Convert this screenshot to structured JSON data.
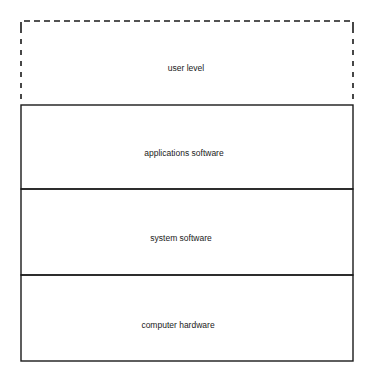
{
  "diagram": {
    "layers": [
      {
        "id": "user-level",
        "label": "user level",
        "style": "dashed"
      },
      {
        "id": "applications-software",
        "label": "applications software",
        "style": "solid"
      },
      {
        "id": "system-software",
        "label": "system software",
        "style": "solid"
      },
      {
        "id": "computer-hardware",
        "label": "computer hardware",
        "style": "solid"
      }
    ],
    "colors": {
      "stroke": "#1a1a1a",
      "background": "#ffffff"
    }
  }
}
